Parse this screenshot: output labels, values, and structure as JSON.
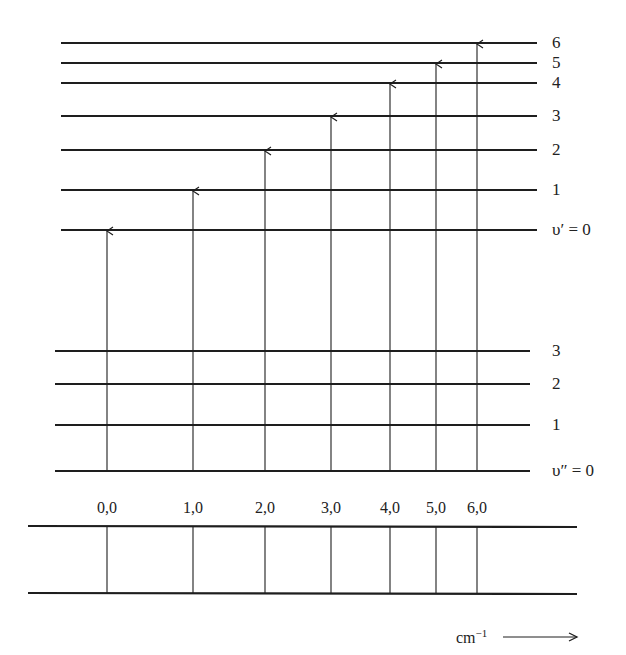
{
  "diagram": {
    "title": "",
    "upper_state": {
      "levels": [
        {
          "v": 0,
          "label": "υ′ = 0",
          "y": 230
        },
        {
          "v": 1,
          "label": "1",
          "y": 190
        },
        {
          "v": 2,
          "label": "2",
          "y": 150
        },
        {
          "v": 3,
          "label": "3",
          "y": 116
        },
        {
          "v": 4,
          "label": "4",
          "y": 83
        },
        {
          "v": 5,
          "label": "5",
          "y": 63
        },
        {
          "v": 6,
          "label": "6",
          "y": 43
        }
      ],
      "x_start": 61,
      "x_end": 537
    },
    "lower_state": {
      "levels": [
        {
          "v": 0,
          "label": "υ″ = 0",
          "y": 471
        },
        {
          "v": 1,
          "label": "1",
          "y": 425
        },
        {
          "v": 2,
          "label": "2",
          "y": 384
        },
        {
          "v": 3,
          "label": "3",
          "y": 351
        }
      ],
      "x_start": 55,
      "x_end": 530
    },
    "transitions": [
      {
        "label": "0,0",
        "upper_v": 0,
        "lower_v": 0,
        "x": 107
      },
      {
        "label": "1,0",
        "upper_v": 1,
        "lower_v": 0,
        "x": 193
      },
      {
        "label": "2,0",
        "upper_v": 2,
        "lower_v": 0,
        "x": 265
      },
      {
        "label": "3,0",
        "upper_v": 3,
        "lower_v": 0,
        "x": 331
      },
      {
        "label": "4,0",
        "upper_v": 4,
        "lower_v": 0,
        "x": 390
      },
      {
        "label": "5,0",
        "upper_v": 5,
        "lower_v": 0,
        "x": 436
      },
      {
        "label": "6,0",
        "upper_v": 6,
        "lower_v": 0,
        "x": 477
      }
    ],
    "spectrum": {
      "top_y": 526,
      "bottom_y": 593,
      "x_start": 28,
      "x_end": 577,
      "axis_unit": "cm",
      "axis_unit_exp": "−1",
      "arrow": "→"
    },
    "colors": {
      "line": "#1e1e1e",
      "background": "#ffffff"
    }
  }
}
